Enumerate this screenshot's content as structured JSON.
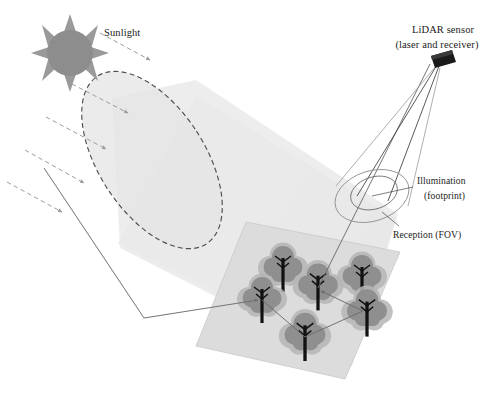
{
  "figure": {
    "background_color": "#ffffff"
  },
  "labels": {
    "sunlight": "Sunlight",
    "lidar_sensor_line1": "LiDAR sensor",
    "lidar_sensor_line2": "(laser and receiver)",
    "illumination_line1": "Illumination",
    "illumination_line2": "(footprint)",
    "reception": "Reception (FOV)"
  },
  "icons": {
    "sun": "sun-icon",
    "sensor": "lidar-sensor-icon",
    "tree": "tree-icon"
  },
  "colors": {
    "sun_fill": "#8d8d8d",
    "sun_ray_fill": "#9a9a9a",
    "sunbeam_cone_fill": "#e9e9e9",
    "sunbeam_cone_edge": "#cfcfcf",
    "sunbeam_ellipse_fill": "#e3e3e3",
    "sunbeam_ellipse_dash": "#4f4f4f",
    "sun_ray_arrow": "#9d9d9d",
    "ground_plane_fill": "#dcdcdc",
    "ground_plane_edge": "#c4c4c4",
    "tree_crown": "#8f8f8f",
    "tree_halo": "#b6b6b6",
    "tree_trunk": "#111111",
    "sensor_body": "#1a1a1a",
    "fov_cone_stroke": "#9b9b9b",
    "beam_cone_stroke": "#4a4a4a",
    "ray_path": "#6d6d6d",
    "label_text": "#1b1b1b",
    "leader_line": "#4a4a4a"
  },
  "geometry": {
    "canvas": {
      "width": 489,
      "height": 393
    },
    "sun": {
      "cx": 70,
      "cy": 53,
      "r": 23,
      "ray_count": 8,
      "ray_length": 13
    },
    "sunlight_label_pos": {
      "x": 104,
      "y": 36
    },
    "sunbeam_ellipse": {
      "cx": 152,
      "cy": 160,
      "rx": 53,
      "ry": 100,
      "rotation": -33
    },
    "ground_plane_corners": [
      {
        "x": 246,
        "y": 222
      },
      {
        "x": 400,
        "y": 252
      },
      {
        "x": 345,
        "y": 379
      },
      {
        "x": 196,
        "y": 346
      }
    ],
    "sensor": {
      "x": 434,
      "y": 57,
      "width": 20,
      "height": 10,
      "skew": -22
    },
    "illumination_ellipse": {
      "cx": 374,
      "cy": 194,
      "rx": 24,
      "ry": 16,
      "rotation": -18
    },
    "reception_ellipse": {
      "cx": 372,
      "cy": 196,
      "rx": 38,
      "ry": 25,
      "rotation": -18
    },
    "trees": [
      {
        "id": "tree-1",
        "x": 283,
        "y": 272,
        "scale": 1.0
      },
      {
        "id": "tree-2",
        "x": 262,
        "y": 303,
        "scale": 1.0
      },
      {
        "id": "tree-3",
        "x": 318,
        "y": 292,
        "scale": 1.02
      },
      {
        "id": "tree-4",
        "x": 362,
        "y": 283,
        "scale": 1.0
      },
      {
        "id": "tree-5",
        "x": 367,
        "y": 316,
        "scale": 1.03
      },
      {
        "id": "tree-6",
        "x": 305,
        "y": 340,
        "scale": 1.05
      }
    ],
    "sun_rays": [
      {
        "x1": 98,
        "y1": 34,
        "x2": 152,
        "y2": 62
      },
      {
        "x1": 70,
        "y1": 84,
        "x2": 130,
        "y2": 112
      },
      {
        "x1": 45,
        "y1": 117,
        "x2": 108,
        "y2": 148
      },
      {
        "x1": 24,
        "y1": 150,
        "x2": 86,
        "y2": 182
      },
      {
        "x1": 6,
        "y1": 182,
        "x2": 64,
        "y2": 212
      }
    ],
    "scatter_path": [
      {
        "x": 63,
        "y": 178
      },
      {
        "x": 144,
        "y": 318
      },
      {
        "x": 262,
        "y": 300
      },
      {
        "x": 305,
        "y": 337
      },
      {
        "x": 366,
        "y": 310
      },
      {
        "x": 318,
        "y": 288
      },
      {
        "x": 432,
        "y": 64
      }
    ]
  }
}
